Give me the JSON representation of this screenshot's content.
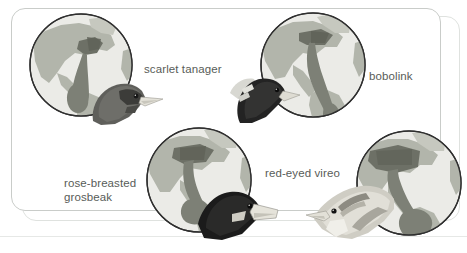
{
  "figure": {
    "style": "grayscale textbook illustration",
    "frame": {
      "shape": "rounded-rectangle",
      "border_color": "#c9ccc9",
      "background_color": "#ffffff"
    },
    "label_color": "#585c58"
  },
  "palette": {
    "ocean": "#ebebe7",
    "land": "#b2b5ab",
    "land_light": "#c6c8bf",
    "range_dark": "#7d8076",
    "range_darker": "#6d7066",
    "globe_outline": "#2f2f2f",
    "bird_dark": "#2b2b2b",
    "bird_mid": "#7a7a76",
    "bird_light": "#d8d8d2",
    "beak": "#e6e4db"
  },
  "birds": [
    {
      "id": "scarlet-tanager",
      "label": "scarlet tanager",
      "label_lines": [
        "scarlet tanager"
      ],
      "globe_name": "globe-scarlet-tanager",
      "bird_name": "bird-head-scarlet-tanager",
      "head_tone": "dark",
      "range_description": "eastern North America to northwestern South America"
    },
    {
      "id": "bobolink",
      "label": "bobolink",
      "label_lines": [
        "bobolink"
      ],
      "globe_name": "globe-bobolink",
      "bird_name": "bird-head-bobolink",
      "head_tone": "black-and-white",
      "range_description": "northern United States and southern Canada to southern South America"
    },
    {
      "id": "rose-breasted-grosbeak",
      "label": "rose-breasted\ngrosbeak",
      "label_lines": [
        "rose-breasted",
        "grosbeak"
      ],
      "globe_name": "globe-rose-breasted-grosbeak",
      "bird_name": "bird-head-rose-breasted-grosbeak",
      "head_tone": "black",
      "range_description": "northeastern North America to Central America and northern South America"
    },
    {
      "id": "red-eyed-vireo",
      "label": "red-eyed vireo",
      "label_lines": [
        "red-eyed vireo"
      ],
      "globe_name": "globe-red-eyed-vireo",
      "bird_name": "bird-head-red-eyed-vireo",
      "head_tone": "pale",
      "range_description": "North America to the Amazon basin of South America"
    }
  ]
}
